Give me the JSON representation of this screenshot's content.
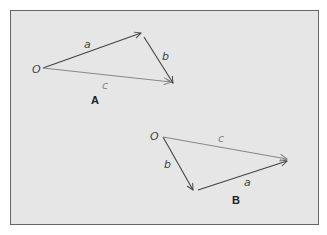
{
  "diagram": {
    "panel_background": "#e6e6e6",
    "border_color": "#666666",
    "figures": [
      {
        "caption": "A",
        "origin_label": "O",
        "vectors": [
          {
            "label": "a",
            "color": "#444444"
          },
          {
            "label": "b",
            "color": "#444444"
          },
          {
            "label": "c",
            "color": "#888888"
          }
        ]
      },
      {
        "caption": "B",
        "origin_label": "O",
        "vectors": [
          {
            "label": "b",
            "color": "#444444"
          },
          {
            "label": "a",
            "color": "#444444"
          },
          {
            "label": "c",
            "color": "#888888"
          }
        ]
      }
    ]
  }
}
